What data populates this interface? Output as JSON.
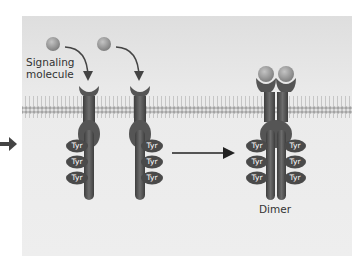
{
  "diagram": {
    "type": "receptor-tyrosine-kinase-dimerization",
    "labels": {
      "signaling_molecule_line1": "Signaling",
      "signaling_molecule_line2": "molecule",
      "dimer": "Dimer",
      "tyr": "Tyr"
    },
    "receptors_left": [
      {
        "name": "receptor-1",
        "tyr_side": "left",
        "tyr_count": 3
      },
      {
        "name": "receptor-2",
        "tyr_side": "right",
        "tyr_count": 3
      }
    ],
    "dimer": {
      "tyr_per_side": 3
    },
    "colors": {
      "background": "#ececec",
      "receptor": "#5a5a5a",
      "tyr_domain": "#4d4d4d",
      "ligand": "#8f8f8f",
      "membrane": "#b5b5b5",
      "arrow": "#222222"
    }
  }
}
